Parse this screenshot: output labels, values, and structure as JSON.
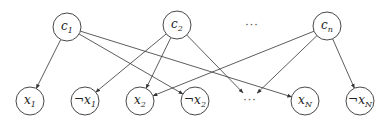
{
  "diagram": {
    "type": "bipartite-directed-graph",
    "top_nodes": [
      {
        "id": "c1",
        "base": "c",
        "sub": "1",
        "cx": 67,
        "cy": 27
      },
      {
        "id": "c2",
        "base": "c",
        "sub": "2",
        "cx": 177,
        "cy": 25
      },
      {
        "id": "cn",
        "base": "c",
        "sub": "n",
        "cx": 327,
        "cy": 26
      }
    ],
    "top_ellipsis": {
      "text": "···",
      "x": 252,
      "y": 29
    },
    "bottom_nodes": [
      {
        "id": "x1",
        "neg": "",
        "base": "x",
        "sub": "1",
        "cx": 30,
        "cy": 101
      },
      {
        "id": "nx1",
        "neg": "¬",
        "base": "x",
        "sub": "1",
        "cx": 85,
        "cy": 101
      },
      {
        "id": "x2",
        "neg": "",
        "base": "x",
        "sub": "2",
        "cx": 140,
        "cy": 101
      },
      {
        "id": "nx2",
        "neg": "¬",
        "base": "x",
        "sub": "2",
        "cx": 195,
        "cy": 101
      },
      {
        "id": "xN",
        "neg": "",
        "base": "x",
        "sub": "N",
        "cx": 305,
        "cy": 101
      },
      {
        "id": "nxN",
        "neg": "¬",
        "base": "x",
        "sub": "N",
        "cx": 360,
        "cy": 101
      }
    ],
    "bottom_ellipsis": {
      "text": "···",
      "x": 250,
      "y": 104
    },
    "edges": [
      {
        "from": "c1",
        "to": "x1"
      },
      {
        "from": "c1",
        "to": "nx2"
      },
      {
        "from": "c1",
        "to": "xN"
      },
      {
        "from": "c2",
        "to": "nx1"
      },
      {
        "from": "c2",
        "to": "x2"
      },
      {
        "from": "c2",
        "to": "bottom_ellipsis"
      },
      {
        "from": "cn",
        "to": "x2"
      },
      {
        "from": "cn",
        "to": "bottom_ellipsis"
      },
      {
        "from": "cn",
        "to": "nxN"
      }
    ],
    "node_radius": 14,
    "colors": {
      "stroke": "#333333",
      "fill": "#ffffff",
      "text": "#222222"
    }
  }
}
